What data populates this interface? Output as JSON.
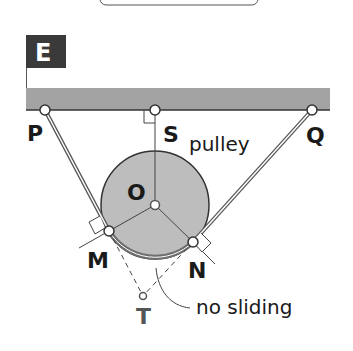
{
  "diagram": {
    "title_box": {
      "text": ""
    },
    "frame_label": "E",
    "points": {
      "P": {
        "label": "P",
        "x": 45,
        "y": 110
      },
      "S": {
        "label": "S",
        "x": 155,
        "y": 110
      },
      "Q": {
        "label": "Q",
        "x": 312,
        "y": 110
      },
      "O": {
        "label": "O",
        "x": 155,
        "y": 205
      },
      "M": {
        "label": "M",
        "x": 109,
        "y": 231
      },
      "N": {
        "label": "N",
        "x": 193,
        "y": 242
      },
      "T": {
        "label": "T",
        "x": 143,
        "y": 296
      }
    },
    "pulley": {
      "label": "pulley",
      "radius": 54
    },
    "annotation": {
      "text": "no sliding"
    },
    "colors": {
      "frame_box": "#3a3a3a",
      "beam": "#a3a3a3",
      "pulley_fill": "#bdbdbd",
      "line": "#333333",
      "rope_band": "#6e6e6e"
    }
  }
}
